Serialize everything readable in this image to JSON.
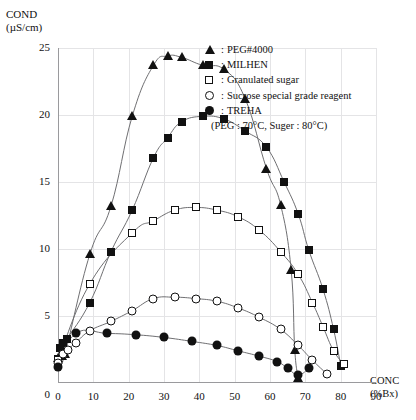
{
  "axes": {
    "y_title_line1": "COND",
    "y_title_line2": "(µS/cm)",
    "x_title_line1": "CONC",
    "x_title_line2": "(%Bx)",
    "y_ticks": [
      "0",
      "5",
      "10",
      "15",
      "20",
      "25"
    ],
    "x_ticks": [
      "0",
      "10",
      "20",
      "30",
      "40",
      "50",
      "60",
      "70",
      "80",
      "90"
    ]
  },
  "legend": {
    "separator": ":",
    "items": [
      {
        "marker": "filled-triangle",
        "label": "PEG#4000"
      },
      {
        "marker": "filled-square",
        "label": "MILHEN"
      },
      {
        "marker": "open-square",
        "label": "Granulated sugar"
      },
      {
        "marker": "open-circle",
        "label": "Sucrose special grade reagent"
      },
      {
        "marker": "filled-circle",
        "label": "TREHA"
      }
    ],
    "note": "(PEG : 70°C, Suger : 80°C)"
  },
  "colors": {
    "marker": "#111111",
    "curve": "#6f6f72",
    "grid": "#e4e4e6",
    "axis": "#9a9a9d",
    "background": "#ffffff"
  },
  "chart_data": {
    "type": "scatter",
    "title": "",
    "xlabel": "CONC (%Bx)",
    "ylabel": "COND (µS/cm)",
    "xlim": [
      0,
      90
    ],
    "ylim": [
      0,
      25
    ],
    "grid": true,
    "legend_position": "top-right",
    "series": [
      {
        "name": "PEG#4000",
        "marker": "filled-triangle",
        "x": [
          0,
          1,
          2,
          9,
          15,
          21,
          27,
          31,
          35,
          41,
          47,
          53,
          59,
          63,
          66,
          67,
          68
        ],
        "y": [
          1.9,
          2.0,
          2.2,
          9.6,
          13.2,
          19.9,
          23.7,
          24.4,
          24.3,
          23.7,
          23.4,
          21.2,
          16.0,
          13.3,
          8.4,
          2.5,
          0.4
        ]
      },
      {
        "name": "MILHEN",
        "marker": "filled-square",
        "x": [
          0,
          0.6,
          1.5,
          2.5,
          9,
          15,
          21,
          27,
          31,
          35,
          41,
          47,
          53,
          59,
          64,
          68,
          71,
          75,
          78,
          80
        ],
        "y": [
          1.8,
          2.6,
          3.0,
          3.3,
          6.0,
          9.8,
          12.9,
          16.8,
          18.3,
          19.5,
          19.9,
          19.7,
          18.8,
          17.6,
          15.0,
          12.6,
          9.9,
          7.0,
          4.0,
          1.3
        ]
      },
      {
        "name": "Granulated sugar",
        "marker": "open-square",
        "x": [
          0,
          9,
          21,
          27,
          33,
          39,
          45,
          51,
          57,
          63,
          68,
          72,
          75,
          78,
          81
        ],
        "y": [
          1.7,
          7.4,
          11.2,
          12.1,
          12.9,
          13.1,
          12.9,
          12.4,
          11.4,
          9.8,
          8.1,
          6.0,
          4.2,
          2.4,
          1.4
        ]
      },
      {
        "name": "Sucrose special grade reagent",
        "marker": "open-circle",
        "x": [
          0,
          1.5,
          2.8,
          5,
          9,
          15,
          21,
          27,
          33,
          39,
          45,
          51,
          57,
          63,
          68,
          72,
          76
        ],
        "y": [
          1.5,
          2.2,
          2.5,
          3.0,
          3.9,
          4.6,
          5.4,
          6.3,
          6.4,
          6.3,
          6.1,
          5.6,
          4.9,
          4.0,
          2.8,
          1.7,
          0.7
        ]
      },
      {
        "name": "TREHA",
        "marker": "filled-circle",
        "x": [
          0,
          5,
          14,
          22,
          30,
          38,
          45,
          51,
          57,
          62,
          65,
          68,
          71
        ],
        "y": [
          1.2,
          3.7,
          3.7,
          3.6,
          3.4,
          3.1,
          2.8,
          2.4,
          2.0,
          1.6,
          1.1,
          0.6,
          1.1
        ]
      }
    ]
  }
}
